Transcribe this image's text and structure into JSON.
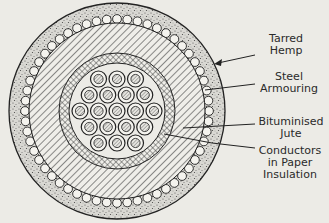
{
  "figure": {
    "type": "cross-section diagram",
    "colors": {
      "background": "#ecebe6",
      "ink": "#2a2a2a",
      "hemp_fill": "#d8d7d2"
    },
    "conductor_count": 19,
    "conductor_rows": [
      3,
      4,
      5,
      4,
      3
    ]
  },
  "labels": [
    {
      "id": "tarred-hemp",
      "text": "Tarred\nHemp"
    },
    {
      "id": "steel-armouring",
      "text": "Steel\nArmouring"
    },
    {
      "id": "bituminised-jute",
      "text": "Bituminised\nJute"
    },
    {
      "id": "conductors",
      "text": "Conductors\nin Paper\nInsulation"
    }
  ]
}
